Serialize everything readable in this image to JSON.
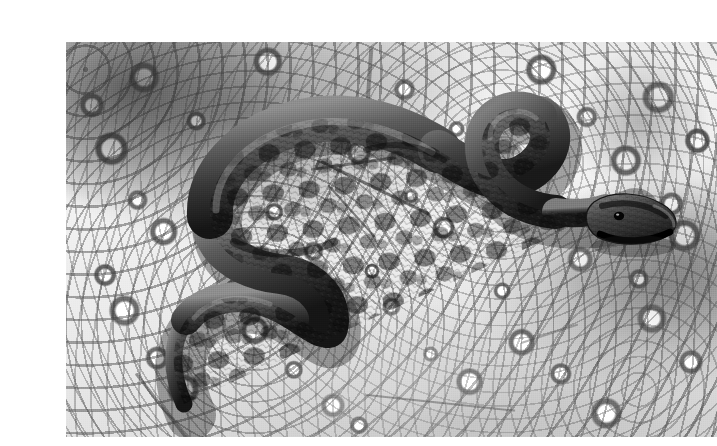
{
  "page": {
    "background_color": "#ffffff",
    "width": 702,
    "height": 446
  },
  "photo": {
    "alt_text": "Black and white photograph of a banded snake coiled on white limestone gravel",
    "caption": "",
    "frame": {
      "left": 26,
      "top": 26,
      "width": 651,
      "height": 395,
      "border_color": "#ffffff"
    },
    "rendering": {
      "color_mode": "grayscale",
      "gravel_highlight": "#ffffff",
      "gravel_midtone": "#d6d6d6",
      "gravel_shadow": "#5b5b5b",
      "vegetation_shadow": "#2a2a2a"
    }
  },
  "subject": {
    "name": "snake",
    "description": "Coiled snake with dark saddle blotches on a lighter ground colour",
    "pose": "S-coiled, head raised at right, tail trailing to lower left",
    "colors": {
      "body_light": "#7a7a7a",
      "body_mid": "#4e4e4e",
      "body_dark": "#242424",
      "blotch": "#141414",
      "highlight": "#9a9a9a"
    },
    "parts": [
      {
        "id": "head",
        "label": "snake head",
        "center_x": 572,
        "center_y": 186
      },
      {
        "id": "neck",
        "label": "snake neck",
        "center_x": 500,
        "center_y": 130
      },
      {
        "id": "fore-body",
        "label": "snake fore body",
        "center_x": 400,
        "center_y": 140
      },
      {
        "id": "mid-body",
        "label": "snake mid body",
        "center_x": 240,
        "center_y": 120
      },
      {
        "id": "coil",
        "label": "snake body coil",
        "center_x": 215,
        "center_y": 215
      },
      {
        "id": "rear-body",
        "label": "snake rear body",
        "center_x": 200,
        "center_y": 290
      },
      {
        "id": "tail",
        "label": "snake tail",
        "center_x": 140,
        "center_y": 360
      }
    ]
  },
  "scene": {
    "substrate": "crushed white limestone gravel",
    "litter": [
      {
        "id": "twig-1",
        "label": "dry twig"
      },
      {
        "id": "twig-2",
        "label": "dry twig"
      },
      {
        "id": "twig-3",
        "label": "dry stem"
      },
      {
        "id": "twig-4",
        "label": "dry stem"
      },
      {
        "id": "twig-5",
        "label": "dry grass blade"
      },
      {
        "id": "twig-6",
        "label": "dry grass blade"
      }
    ],
    "vegetation_region": {
      "label": "shaded vegetation",
      "position": "upper-left"
    }
  }
}
